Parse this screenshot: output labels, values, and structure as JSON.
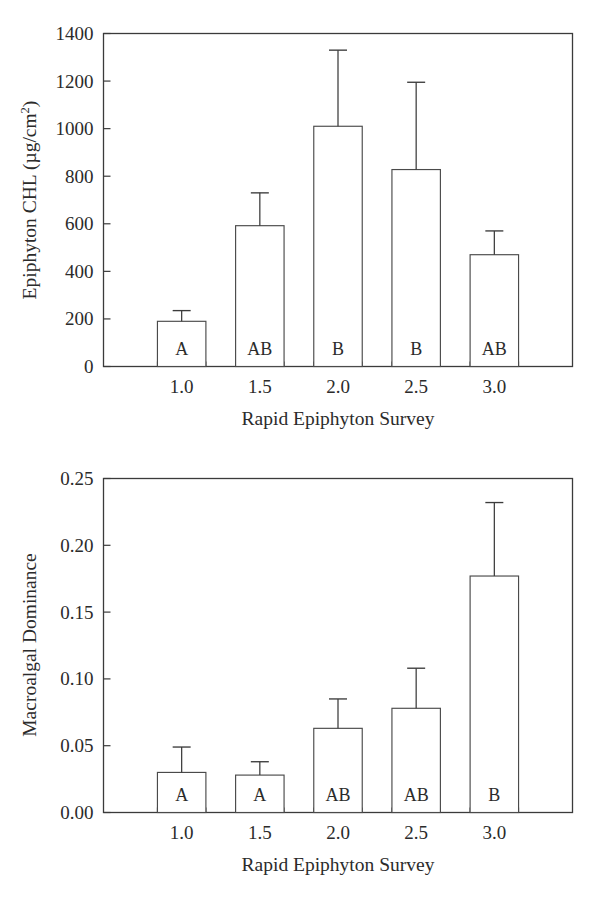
{
  "figure": {
    "background": "#ffffff",
    "ink_color": "#2b2b2b",
    "bar_fill": "#ffffff",
    "bar_stroke": "#4a4a4a"
  },
  "chart_data": [
    {
      "type": "bar",
      "panel": "top",
      "title": "",
      "xlabel": "Rapid Epiphyton Survey",
      "ylabel_text": "Epiphyton CHL (µg/cm",
      "ylabel_sup": "2",
      "ylabel_tail": ")",
      "ylabel_full": "Epiphyton CHL (µg/cm2)",
      "categories": [
        "1.0",
        "1.5",
        "2.0",
        "2.5",
        "3.0"
      ],
      "values": [
        190,
        592,
        1010,
        828,
        470
      ],
      "error_upper": [
        235,
        730,
        1330,
        1195,
        570
      ],
      "group_letters": [
        "A",
        "AB",
        "B",
        "B",
        "AB"
      ],
      "ylim": [
        0,
        1400
      ],
      "ytick_values": [
        0,
        200,
        400,
        600,
        800,
        1000,
        1200,
        1400
      ],
      "ytick_labels": [
        "0",
        "200",
        "400",
        "600",
        "800",
        "1000",
        "1200",
        "1400"
      ],
      "xtick_labels": [
        "1.0",
        "1.5",
        "2.0",
        "2.5",
        "3.0"
      ],
      "grid": false,
      "legend": "none",
      "error_type": "upper-only"
    },
    {
      "type": "bar",
      "panel": "bottom",
      "title": "",
      "xlabel": "Rapid Epiphyton Survey",
      "ylabel_text": "Macroalgal Dominance",
      "ylabel_sup": "",
      "ylabel_tail": "",
      "ylabel_full": "Macroalgal Dominance",
      "categories": [
        "1.0",
        "1.5",
        "2.0",
        "2.5",
        "3.0"
      ],
      "values": [
        0.03,
        0.028,
        0.063,
        0.078,
        0.177
      ],
      "error_upper": [
        0.049,
        0.038,
        0.085,
        0.108,
        0.232
      ],
      "group_letters": [
        "A",
        "A",
        "AB",
        "AB",
        "B"
      ],
      "ylim": [
        0,
        0.25
      ],
      "ytick_values": [
        0.0,
        0.05,
        0.1,
        0.15,
        0.2,
        0.25
      ],
      "ytick_labels": [
        "0.00",
        "0.05",
        "0.10",
        "0.15",
        "0.20",
        "0.25"
      ],
      "xtick_labels": [
        "1.0",
        "1.5",
        "2.0",
        "2.5",
        "3.0"
      ],
      "grid": false,
      "legend": "none",
      "error_type": "upper-only"
    }
  ]
}
